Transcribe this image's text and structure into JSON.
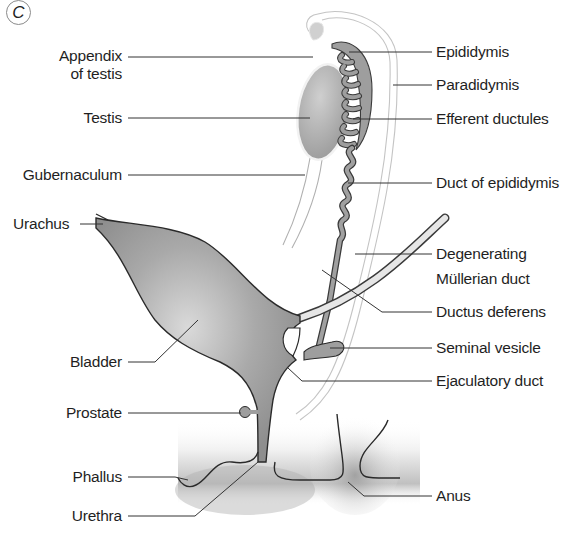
{
  "figure": {
    "panel_letter": "C"
  },
  "labels": {
    "left": [
      {
        "id": "appendix-of-testis",
        "line1": "Appendix",
        "line2": "of testis"
      },
      {
        "id": "testis",
        "line1": "Testis"
      },
      {
        "id": "gubernaculum",
        "line1": "Gubernaculum"
      },
      {
        "id": "urachus",
        "line1": "Urachus"
      },
      {
        "id": "bladder",
        "line1": "Bladder"
      },
      {
        "id": "prostate",
        "line1": "Prostate"
      },
      {
        "id": "phallus",
        "line1": "Phallus"
      },
      {
        "id": "urethra",
        "line1": "Urethra"
      }
    ],
    "right": [
      {
        "id": "epididymis",
        "line1": "Epididymis"
      },
      {
        "id": "paradidymis",
        "line1": "Paradidymis"
      },
      {
        "id": "efferent-ductules",
        "line1": "Efferent ductules"
      },
      {
        "id": "duct-of-epididymis",
        "line1": "Duct of epididymis"
      },
      {
        "id": "degenerating-mullerian-duct",
        "line1": "Degenerating",
        "line2": "Müllerian duct"
      },
      {
        "id": "ductus-deferens",
        "line1": "Ductus deferens"
      },
      {
        "id": "seminal-vesicle",
        "line1": "Seminal vesicle"
      },
      {
        "id": "ejaculatory-duct",
        "line1": "Ejaculatory duct"
      },
      {
        "id": "anus",
        "line1": "Anus"
      }
    ]
  },
  "colors": {
    "organ_fill": "#9a9a9a",
    "organ_highlight": "#d6d6d6",
    "outline": "#2a2a2a",
    "leader_line": "#333333",
    "mullerian_line": "#bdbdbd",
    "background": "#ffffff"
  }
}
